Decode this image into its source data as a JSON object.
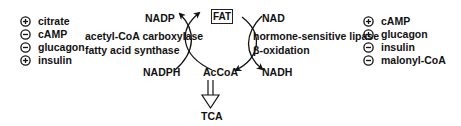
{
  "center": {
    "fat": "FAT",
    "acetyl_coa": "AcCoA",
    "tca": "TCA"
  },
  "synthesis": {
    "cofactor_in": "NADPH",
    "cofactor_out": "NADP",
    "enzymes": [
      "acetyl-CoA carboxylase",
      "fatty acid synthase"
    ],
    "regulators": [
      {
        "sign": "+",
        "label": "citrate"
      },
      {
        "sign": "-",
        "label": "cAMP"
      },
      {
        "sign": "-",
        "label": "glucagon"
      },
      {
        "sign": "+",
        "label": "insulin"
      }
    ]
  },
  "degradation": {
    "cofactor_in": "NAD",
    "cofactor_out": "NADH",
    "enzymes": [
      "hormone-sensitive lipase",
      "β-oxidation"
    ],
    "regulators": [
      {
        "sign": "+",
        "label": "cAMP"
      },
      {
        "sign": "+",
        "label": "glucagon"
      },
      {
        "sign": "-",
        "label": "insulin"
      },
      {
        "sign": "-",
        "label": "malonyl-CoA"
      }
    ]
  },
  "colors": {
    "ink": "#111111",
    "background": "#ffffff"
  }
}
